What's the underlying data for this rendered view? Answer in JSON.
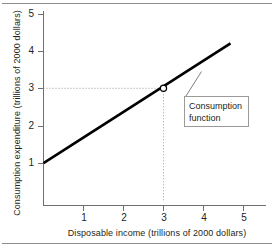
{
  "figure": {
    "name": "consumption-function-figure",
    "background_color": "#ffffff",
    "rule_color": "#8c8c8c",
    "ink_color": "#231f20"
  },
  "annotation": {
    "label_line1": "Consumption",
    "label_line2": "function"
  },
  "chart_data": {
    "type": "line",
    "title": "",
    "xlabel": "Disposable income (trillions of 2000 dollars)",
    "ylabel": "Consumption expenditure (trillions of 2000 dollars)",
    "xlim": [
      0,
      5.5
    ],
    "ylim": [
      0,
      5.3
    ],
    "xticks": [
      1,
      2,
      3,
      4,
      5
    ],
    "yticks": [
      1,
      2,
      3,
      4,
      5
    ],
    "xtick_labels": [
      "1",
      "2",
      "3",
      "4",
      "5"
    ],
    "ytick_labels": [
      "1",
      "2",
      "3",
      "4",
      "5"
    ],
    "grid": false,
    "legend": null,
    "series": [
      {
        "name": "Consumption function",
        "type": "line",
        "color": "#000000",
        "line_width": 2.6,
        "x": [
          0,
          4.675
        ],
        "y": [
          1.0,
          4.2
        ],
        "slope": 0.684,
        "intercept": 1.0
      }
    ],
    "markers": [
      {
        "name": "reference-point",
        "x": 3.0,
        "y": 3.0,
        "style": "open-circle",
        "face_color": "#ffffff",
        "edge_color": "#000000"
      }
    ],
    "guide_lines": [
      {
        "name": "horizontal-guide",
        "orientation": "horizontal",
        "value": 3.0,
        "from": 0,
        "to": 3.0,
        "style": "dotted",
        "color": "#9a9a9a"
      },
      {
        "name": "vertical-guide",
        "orientation": "vertical",
        "value": 3.0,
        "from": 0,
        "to": 3.0,
        "style": "dotted",
        "color": "#9a9a9a"
      }
    ],
    "annotations": [
      {
        "name": "consumption-function-callout",
        "text": "Consumption function",
        "points_to_x": 3.95,
        "points_to_y": 3.45
      }
    ]
  }
}
